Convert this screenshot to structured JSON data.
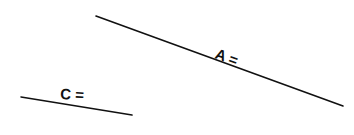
{
  "diagram": {
    "background": "#ffffff",
    "stroke_color": "#111111",
    "segments": [
      {
        "id": "A",
        "label": "A =",
        "x1": 96,
        "y1": 16,
        "x2": 343,
        "y2": 106,
        "label_x": 214,
        "label_y": 58,
        "label_rotate": 20
      },
      {
        "id": "C",
        "label": "C =",
        "x1": 21,
        "y1": 97,
        "x2": 132,
        "y2": 115,
        "label_x": 60,
        "label_y": 99,
        "label_rotate": 3
      }
    ]
  }
}
